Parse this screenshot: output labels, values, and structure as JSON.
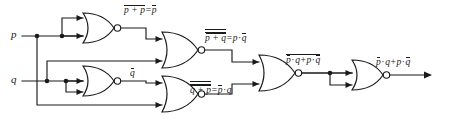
{
  "figure": {
    "kind": "logic-circuit-diagram",
    "ink_color": "#1a1a1a",
    "background_color": "#ffffff"
  },
  "inputs": [
    {
      "id": "p",
      "label": "p"
    },
    {
      "id": "q",
      "label": "q"
    }
  ],
  "gates": [
    {
      "id": "g1",
      "type": "NOR",
      "role": "inverter-p",
      "output_label_id": "lab_nor1"
    },
    {
      "id": "g2",
      "type": "NOR",
      "role": "inverter-q",
      "output_label_id": "lab_nor2"
    },
    {
      "id": "g3",
      "type": "NOR",
      "role": "p-notq-term",
      "output_label_id": "lab_nor3"
    },
    {
      "id": "g4",
      "type": "NOR",
      "role": "notp-q-term",
      "output_label_id": "lab_nor4"
    },
    {
      "id": "g5",
      "type": "NOR",
      "role": "sum-nor",
      "output_label_id": "lab_nor5"
    },
    {
      "id": "g6",
      "type": "NOR",
      "role": "final-inverter",
      "output_label_id": "lab_out"
    }
  ],
  "labels": {
    "input_p": {
      "text": "p"
    },
    "input_q": {
      "text": "q"
    },
    "nor1": {
      "lhs_inner": "p + p",
      "rhs": "p",
      "equals": "=",
      "full_text": "‾p + p‾ = p̄"
    },
    "nor2": {
      "text": "q",
      "full_text": "q̄"
    },
    "nor3": {
      "lhs_inner": "p + q",
      "rhs_left": "p",
      "rhs_op": "·",
      "rhs_right": "q",
      "equals": "=",
      "full_text": "p̄ + q (double bar) = p · q̄"
    },
    "nor4": {
      "lhs_inner": "q + p",
      "rhs_left": "p",
      "rhs_op": "·",
      "rhs_right": "q",
      "equals": "=",
      "full_text": "q̄ + p (double bar) = p̄ · q"
    },
    "nor5": {
      "t1_left": "p",
      "t1_op": "·",
      "t1_right": "q",
      "plus": "+",
      "t2_left": "p",
      "t2_op": "·",
      "t2_right": "q",
      "full_text": "‾p̄ · q + p · q̄‾"
    },
    "output": {
      "t1_left": "p",
      "t1_op": "·",
      "t1_right": "q",
      "plus": "+",
      "t2_left": "p",
      "t2_op": "·",
      "t2_right": "q",
      "full_text": "p̄ · q + p · q̄"
    }
  }
}
